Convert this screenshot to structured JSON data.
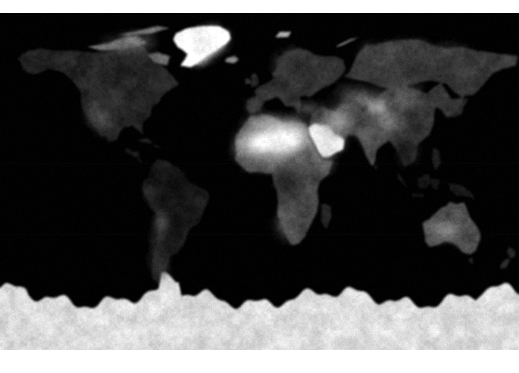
{
  "figure": {
    "kind": "raster-map",
    "projection": "equirectangular",
    "colormap": "grayscale",
    "background_color": "#ffffff",
    "ocean_color": "#000000",
    "max_color": "#ffffff",
    "lon_range": [
      -180,
      180
    ],
    "lat_range": [
      -90,
      90
    ],
    "canvas": {
      "x": 0,
      "y": 13,
      "width": 519,
      "height": 337
    },
    "margins": {
      "top": 13,
      "bottom": 23,
      "left": 0,
      "right": 0
    },
    "gridlines": false,
    "axis_labels": false,
    "tick_labels": [],
    "legend": null,
    "colorbar": null,
    "annotations": []
  },
  "chart_data": {
    "type": "heatmap",
    "xlabel": "",
    "ylabel": "",
    "xlim": [
      -180,
      180
    ],
    "ylim": [
      -90,
      90
    ],
    "grid": false,
    "legend_position": "none",
    "colormap": "gray",
    "value_range": [
      0,
      1
    ],
    "regions": [
      {
        "name": "ocean",
        "lon": [
          -180,
          180
        ],
        "lat": [
          -90,
          90
        ],
        "brightness": 0.02
      },
      {
        "name": "greenland-ice-sheet",
        "lon": [
          -55,
          -20
        ],
        "lat": [
          60,
          84
        ],
        "brightness": 1.0
      },
      {
        "name": "antarctic-ice-sheet",
        "lon": [
          -180,
          180
        ],
        "lat": [
          -90,
          -62
        ],
        "brightness": 0.88
      },
      {
        "name": "sahara-desert",
        "lon": [
          -17,
          33
        ],
        "lat": [
          14,
          32
        ],
        "brightness": 0.97
      },
      {
        "name": "arabian-peninsula",
        "lon": [
          34,
          56
        ],
        "lat": [
          13,
          32
        ],
        "brightness": 0.92
      },
      {
        "name": "sahel",
        "lon": [
          -17,
          38
        ],
        "lat": [
          8,
          16
        ],
        "brightness": 0.58
      },
      {
        "name": "north-africa-coast",
        "lon": [
          -10,
          32
        ],
        "lat": [
          30,
          37
        ],
        "brightness": 0.7
      },
      {
        "name": "central-asia-deserts",
        "lon": [
          55,
          92
        ],
        "lat": [
          36,
          50
        ],
        "brightness": 0.55
      },
      {
        "name": "tibetan-plateau",
        "lon": [
          76,
          100
        ],
        "lat": [
          28,
          38
        ],
        "brightness": 0.52
      },
      {
        "name": "iran-plateau",
        "lon": [
          45,
          70
        ],
        "lat": [
          25,
          38
        ],
        "brightness": 0.58
      },
      {
        "name": "australia-interior",
        "lon": [
          118,
          142
        ],
        "lat": [
          -30,
          -20
        ],
        "brightness": 0.48
      },
      {
        "name": "australia",
        "lon": [
          113,
          154
        ],
        "lat": [
          -39,
          -11
        ],
        "brightness": 0.33
      },
      {
        "name": "north-america",
        "lon": [
          -168,
          -52
        ],
        "lat": [
          25,
          72
        ],
        "brightness": 0.16
      },
      {
        "name": "north-america-southwest",
        "lon": [
          -120,
          -100
        ],
        "lat": [
          24,
          40
        ],
        "brightness": 0.3
      },
      {
        "name": "canadian-arctic",
        "lon": [
          -130,
          -60
        ],
        "lat": [
          66,
          83
        ],
        "brightness": 0.45
      },
      {
        "name": "south-america",
        "lon": [
          -82,
          -34
        ],
        "lat": [
          -56,
          12
        ],
        "brightness": 0.12
      },
      {
        "name": "andes",
        "lon": [
          -78,
          -66
        ],
        "lat": [
          -45,
          0
        ],
        "brightness": 0.28
      },
      {
        "name": "amazon-basin",
        "lon": [
          -74,
          -48
        ],
        "lat": [
          -12,
          6
        ],
        "brightness": 0.09
      },
      {
        "name": "sub-saharan-africa",
        "lon": [
          8,
          42
        ],
        "lat": [
          -34,
          8
        ],
        "brightness": 0.18
      },
      {
        "name": "kalahari-namib",
        "lon": [
          12,
          26
        ],
        "lat": [
          -28,
          -18
        ],
        "brightness": 0.4
      },
      {
        "name": "europe",
        "lon": [
          -10,
          40
        ],
        "lat": [
          36,
          60
        ],
        "brightness": 0.22
      },
      {
        "name": "scandinavia",
        "lon": [
          5,
          32
        ],
        "lat": [
          56,
          71
        ],
        "brightness": 0.26
      },
      {
        "name": "siberia",
        "lon": [
          60,
          180
        ],
        "lat": [
          50,
          75
        ],
        "brightness": 0.24
      },
      {
        "name": "india",
        "lon": [
          68,
          90
        ],
        "lat": [
          8,
          30
        ],
        "brightness": 0.3
      },
      {
        "name": "southeast-asia",
        "lon": [
          92,
          130
        ],
        "lat": [
          -10,
          24
        ],
        "brightness": 0.12
      },
      {
        "name": "china-east",
        "lon": [
          100,
          125
        ],
        "lat": [
          22,
          42
        ],
        "brightness": 0.22
      },
      {
        "name": "madagascar",
        "lon": [
          43,
          51
        ],
        "lat": [
          -26,
          -12
        ],
        "brightness": 0.16
      },
      {
        "name": "iceland",
        "lon": [
          -25,
          -13
        ],
        "lat": [
          63,
          67
        ],
        "brightness": 0.55
      },
      {
        "name": "new-zealand",
        "lon": [
          166,
          179
        ],
        "lat": [
          -47,
          -34
        ],
        "brightness": 0.18
      },
      {
        "name": "japan",
        "lon": [
          129,
          146
        ],
        "lat": [
          31,
          46
        ],
        "brightness": 0.16
      }
    ]
  }
}
